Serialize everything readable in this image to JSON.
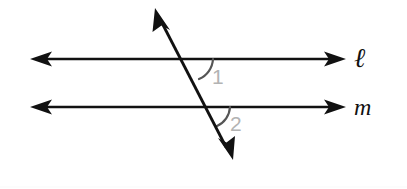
{
  "figure": {
    "background_color": "#ffffff",
    "width": 407,
    "height": 189
  },
  "lines": [
    {
      "id": "line-l",
      "label": "ℓ",
      "label_name": "script-ell",
      "description": "upper horizontal parallel line with arrowheads on both ends",
      "color": "#111111",
      "stroke_width": 2.6,
      "x1": 32,
      "y1": 59,
      "x2": 344,
      "y2": 59,
      "arrow_start": true,
      "arrow_end": true,
      "label_x": 354,
      "label_y": 45
    },
    {
      "id": "line-m",
      "label": "m",
      "label_name": "italic-m",
      "description": "lower horizontal parallel line with arrowheads on both ends",
      "color": "#111111",
      "stroke_width": 2.6,
      "x1": 32,
      "y1": 107,
      "x2": 344,
      "y2": 107,
      "arrow_start": true,
      "arrow_end": true,
      "label_x": 354,
      "label_y": 95
    },
    {
      "id": "transversal",
      "label": "",
      "label_name": "transversal-line",
      "description": "slanted transversal crossing both parallel lines, arrowheads at top-left and bottom-right",
      "color": "#111111",
      "stroke_width": 2.8,
      "x1": 232,
      "y1": 158,
      "x2": 156,
      "y2": 10,
      "arrow_start": true,
      "arrow_end": true
    }
  ],
  "intersections": [
    {
      "id": "intersection-l",
      "x": 190,
      "y": 59,
      "with": "line-l"
    },
    {
      "id": "intersection-m",
      "x": 208,
      "y": 107,
      "with": "line-m"
    }
  ],
  "angles": [
    {
      "id": "angle-1",
      "number": "1",
      "arc_color": "#555555",
      "number_color": "#b3b3b3",
      "description": "angle below line l and right of the transversal",
      "vertex_x": 190,
      "vertex_y": 59,
      "arc_path": "M 213 59 A 23 23 0 0 1 199 79",
      "number_x": 212,
      "number_y": 66
    },
    {
      "id": "angle-2",
      "number": "2",
      "arc_color": "#555555",
      "number_color": "#b3b3b3",
      "description": "angle below line m and right of the transversal",
      "vertex_x": 208,
      "vertex_y": 107,
      "arc_path": "M 230 107 A 22 22 0 0 1 217 126",
      "number_x": 230,
      "number_y": 113
    }
  ],
  "colors": {
    "stroke": "#111111",
    "arc": "#555555",
    "angle_number": "#b3b3b3",
    "background": "#ffffff"
  }
}
